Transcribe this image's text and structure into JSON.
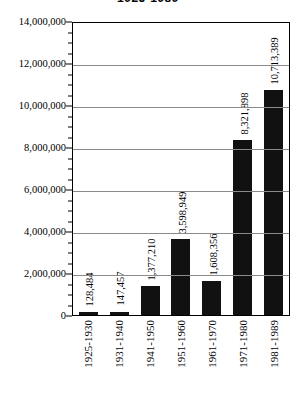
{
  "chart_data": {
    "type": "bar",
    "title": "1925-1989",
    "xlabel": "",
    "ylabel": "",
    "categories": [
      "1925-1930",
      "1931-1940",
      "1941-1950",
      "1951-1960",
      "1961-1970",
      "1971-1980",
      "1981-1989"
    ],
    "values": [
      128484,
      147457,
      1377210,
      3598949,
      1608356,
      8321898,
      10713389
    ],
    "value_labels": [
      "128,484",
      "147,457",
      "1,377,210",
      "3,598,949",
      "1,608,356",
      "8,321,898",
      "10,713,389"
    ],
    "ylim": [
      0,
      14000000
    ],
    "ytick_labels": [
      "0",
      "2,000,000",
      "4,000,000",
      "6,000,000",
      "8,000,000",
      "10,000,000",
      "12,000,000",
      "14,000,000"
    ],
    "ytick_values": [
      0,
      2000000,
      4000000,
      6000000,
      8000000,
      10000000,
      12000000,
      14000000
    ],
    "grid": true,
    "legend": false,
    "bar_color": "#111111",
    "grid_color": "#8a8a8a",
    "axis_color": "#000000"
  }
}
